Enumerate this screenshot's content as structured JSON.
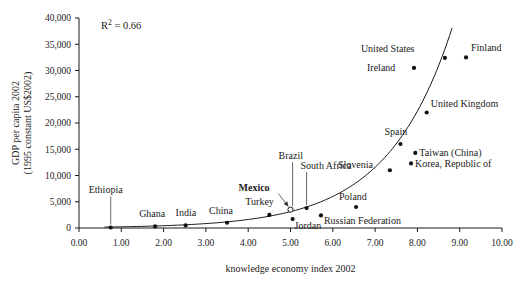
{
  "chart_data": {
    "type": "scatter",
    "title": "",
    "xlabel": "knowledge economy index 2002",
    "ylabel": "GDP per capita 2002\n(1995 constant US$2002)",
    "ylabel_line1": "GDP per capita 2002",
    "ylabel_line2": "(1995 constant US$2002)",
    "xlim": [
      0,
      10
    ],
    "ylim": [
      0,
      40000
    ],
    "xticks": [
      "0.00",
      "1.00",
      "2.00",
      "3.00",
      "4.00",
      "5.00",
      "6.00",
      "7.00",
      "8.00",
      "9.00",
      "10.00"
    ],
    "xtick_values": [
      0,
      1,
      2,
      3,
      4,
      5,
      6,
      7,
      8,
      9,
      10
    ],
    "yticks": [
      "0",
      "5,000",
      "10,000",
      "15,000",
      "20,000",
      "25,000",
      "30,000",
      "35,000",
      "40,000"
    ],
    "ytick_values": [
      0,
      5000,
      10000,
      15000,
      20000,
      25000,
      30000,
      35000,
      40000
    ],
    "grid": false,
    "legend": false,
    "annotation": "R² = 0.66",
    "annotation_r": "R",
    "annotation_exp": "2",
    "annotation_rest": "= 0.66",
    "r_squared": 0.66,
    "trendline": {
      "type": "exponential",
      "description": "fitted exponential curve through points"
    },
    "points": [
      {
        "label": "Ethiopia",
        "x": 0.75,
        "y": 100,
        "marker": "filled",
        "label_dx": -22,
        "label_dy": -34,
        "leader": "vertical"
      },
      {
        "label": "Ghana",
        "x": 1.8,
        "y": 300,
        "marker": "filled",
        "label_dx": -16,
        "label_dy": -9,
        "leader": "none"
      },
      {
        "label": "India",
        "x": 2.52,
        "y": 500,
        "marker": "filled",
        "label_dx": -10,
        "label_dy": -9,
        "leader": "none"
      },
      {
        "label": "China",
        "x": 3.5,
        "y": 1000,
        "marker": "filled",
        "label_dx": -18,
        "label_dy": -9,
        "leader": "none"
      },
      {
        "label": "Turkey",
        "x": 4.5,
        "y": 2500,
        "marker": "filled",
        "label_dx": -24,
        "label_dy": -10,
        "leader": "none"
      },
      {
        "label": "Mexico",
        "x": 5.0,
        "y": 3500,
        "marker": "open",
        "label_dx": -52,
        "label_dy": -19,
        "leader": "arrow",
        "bold": true
      },
      {
        "label": "Brazil",
        "x": 5.05,
        "y": 3600,
        "marker": "none",
        "label_dx": -14,
        "label_dy": -50,
        "leader": "vertical"
      },
      {
        "label": "South Africa",
        "x": 5.38,
        "y": 3800,
        "marker": "filled",
        "label_dx": -6,
        "label_dy": -39,
        "leader": "vertical"
      },
      {
        "label": "Jordan",
        "x": 5.05,
        "y": 1700,
        "marker": "filled",
        "label_dx": 2,
        "label_dy": 10,
        "leader": "none"
      },
      {
        "label": "Russian Federation",
        "x": 5.72,
        "y": 2400,
        "marker": "filled",
        "label_dx": 3,
        "label_dy": 9,
        "leader": "none"
      },
      {
        "label": "Poland",
        "x": 6.55,
        "y": 4000,
        "marker": "filled",
        "label_dx": -17,
        "label_dy": -7,
        "leader": "none"
      },
      {
        "label": "Slovenia",
        "x": 7.35,
        "y": 11000,
        "marker": "filled",
        "label_dx": -52,
        "label_dy": -2,
        "leader": "none"
      },
      {
        "label": "Korea, Republic of",
        "x": 7.85,
        "y": 12300,
        "marker": "filled",
        "label_dx": 4,
        "label_dy": 4,
        "leader": "none"
      },
      {
        "label": "Taiwan (China)",
        "x": 7.95,
        "y": 14300,
        "marker": "filled",
        "label_dx": 4,
        "label_dy": 3,
        "leader": "none"
      },
      {
        "label": "Spain",
        "x": 7.6,
        "y": 16000,
        "marker": "filled",
        "label_dx": -16,
        "label_dy": -9,
        "leader": "none"
      },
      {
        "label": "United Kingdom",
        "x": 8.22,
        "y": 22000,
        "marker": "filled",
        "label_dx": 4,
        "label_dy": -6,
        "leader": "none"
      },
      {
        "label": "Ireland",
        "x": 7.92,
        "y": 30500,
        "marker": "filled",
        "label_dx": -47,
        "label_dy": 3,
        "leader": "none"
      },
      {
        "label": "United States",
        "x": 8.65,
        "y": 32400,
        "marker": "filled",
        "label_dx": -84,
        "label_dy": -6,
        "leader": "none"
      },
      {
        "label": "Finland",
        "x": 9.15,
        "y": 32500,
        "marker": "filled",
        "label_dx": 5,
        "label_dy": -6,
        "leader": "none"
      }
    ]
  }
}
